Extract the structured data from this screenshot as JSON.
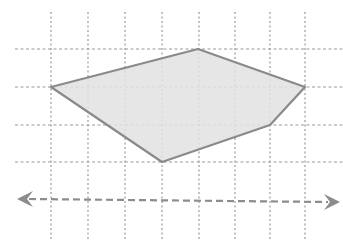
{
  "diagram": {
    "type": "polygon-on-grid",
    "width": 343,
    "height": 248,
    "colors": {
      "background": "#ffffff",
      "grid": "#9a9a9a",
      "polygon_fill": "#e2e2e2",
      "polygon_stroke": "#8a8a8a",
      "arrow": "#8c8c8c"
    },
    "grid": {
      "vertical_x": [
        51,
        88,
        125,
        162,
        199,
        235,
        270,
        305
      ],
      "vertical_y_range": [
        12,
        240
      ],
      "horizontal_y": [
        49,
        87,
        125,
        162
      ],
      "horizontal_x_range": [
        15,
        343
      ],
      "style": "dotted"
    },
    "polygon": {
      "vertices": [
        [
          51,
          87
        ],
        [
          198,
          49
        ],
        [
          305,
          87
        ],
        [
          270,
          125
        ],
        [
          162,
          162
        ]
      ],
      "vertex_count": 5
    },
    "number_line": {
      "start": [
        17,
        199
      ],
      "end": [
        340,
        202
      ],
      "style": "dashed",
      "arrows": "both"
    }
  }
}
